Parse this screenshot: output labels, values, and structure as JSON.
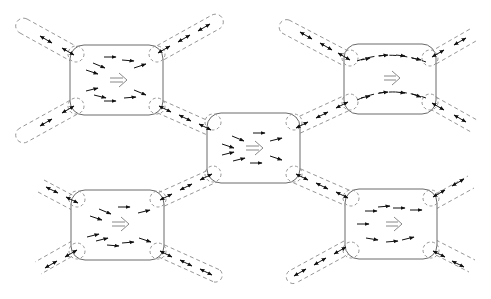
{
  "diagram": {
    "title": "",
    "colors": {
      "box_stroke": "#6a6a6a",
      "dash_stroke": "#8a8a8a",
      "arrow": "#111111",
      "direction_arrow": "#7a7a7a",
      "background": "#ffffff"
    },
    "nodes": [
      {
        "id": "top-left",
        "x": 70,
        "y": 45,
        "w": 93,
        "h": 70,
        "r": 14,
        "flow": "converging",
        "direction_symbol": "⇒"
      },
      {
        "id": "center",
        "x": 207,
        "y": 113,
        "w": 93,
        "h": 70,
        "r": 14,
        "flow": "converging",
        "direction_symbol": "⇒"
      },
      {
        "id": "top-right",
        "x": 344,
        "y": 44,
        "w": 92,
        "h": 70,
        "r": 14,
        "flow": "two-streams",
        "direction_symbol": "⇒"
      },
      {
        "id": "bottom-left",
        "x": 71,
        "y": 190,
        "w": 93,
        "h": 70,
        "r": 14,
        "flow": "converging",
        "direction_symbol": "⇒"
      },
      {
        "id": "bottom-right",
        "x": 345,
        "y": 189,
        "w": 92,
        "h": 70,
        "r": 14,
        "flow": "diverging",
        "direction_symbol": "⇒"
      }
    ],
    "edges": [
      {
        "from": "top-left",
        "to": "center",
        "type": "bidirectional"
      },
      {
        "from": "center",
        "to": "top-right",
        "type": "bidirectional"
      },
      {
        "from": "center",
        "to": "bottom-left",
        "type": "bidirectional"
      },
      {
        "from": "center",
        "to": "bottom-right",
        "type": "bidirectional"
      },
      {
        "from": "top-left",
        "to": "external-nw",
        "type": "bidirectional",
        "closed_end": true
      },
      {
        "from": "top-left",
        "to": "external-sw",
        "type": "bidirectional",
        "closed_end": true
      },
      {
        "from": "top-left",
        "to": "external-ne",
        "type": "bidirectional",
        "closed_end": true
      },
      {
        "from": "top-right",
        "to": "external-nw",
        "type": "bidirectional",
        "closed_end": true
      },
      {
        "from": "top-right",
        "to": "external-ne",
        "type": "bidirectional",
        "closed_end": false
      },
      {
        "from": "top-right",
        "to": "external-se",
        "type": "bidirectional",
        "closed_end": false
      },
      {
        "from": "bottom-left",
        "to": "external-nw",
        "type": "bidirectional",
        "closed_end": false
      },
      {
        "from": "bottom-left",
        "to": "external-sw",
        "type": "bidirectional",
        "closed_end": false
      },
      {
        "from": "bottom-left",
        "to": "external-se",
        "type": "bidirectional",
        "closed_end": true
      },
      {
        "from": "bottom-right",
        "to": "external-sw",
        "type": "bidirectional",
        "closed_end": true
      },
      {
        "from": "bottom-right",
        "to": "external-ne",
        "type": "bidirectional",
        "closed_end": false
      },
      {
        "from": "bottom-right",
        "to": "external-se",
        "type": "bidirectional",
        "closed_end": false
      }
    ],
    "legend": []
  }
}
